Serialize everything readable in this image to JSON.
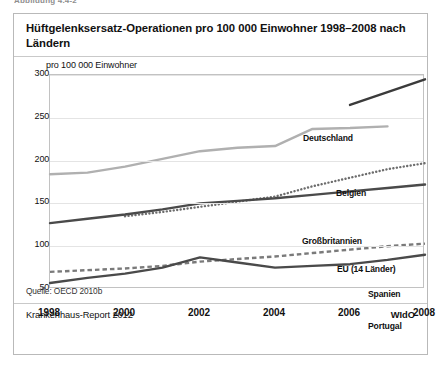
{
  "above_figure_caption": "Abbildung 4.4-2",
  "figure": {
    "title": "Hüftgelenksersatz-Operationen pro 100 000 Einwohner 1998–2008 nach Ländern",
    "source_note": "Quelle: OECD 2010b",
    "footer_left": "Krankenhaus-Report 2012",
    "footer_right": "WIdO"
  },
  "chart_data": {
    "type": "line",
    "title": "Hüftgelenksersatz-Operationen pro 100 000 Einwohner 1998–2008 nach Ländern",
    "xlabel": "",
    "ylabel": "pro 100 000 Einwohner",
    "axis_unit_label": "pro 100 000 Einwohner",
    "x": [
      1998,
      1999,
      2000,
      2001,
      2002,
      2003,
      2004,
      2005,
      2006,
      2007,
      2008
    ],
    "xlim": [
      1998,
      2008
    ],
    "ylim": [
      50,
      300
    ],
    "yticks": [
      50,
      100,
      150,
      200,
      250,
      300
    ],
    "xticks": [
      1998,
      2000,
      2002,
      2004,
      2006,
      2008
    ],
    "grid": true,
    "legend_position": "inline-right-of-line",
    "series": [
      {
        "name": "Deutschland",
        "style": "solid",
        "color": "#3b3b3b",
        "width": 2.4,
        "x": [
          2006,
          2007,
          2008
        ],
        "values": [
          265,
          280,
          295
        ]
      },
      {
        "name": "Belgien",
        "style": "solid",
        "color": "#b0b0b0",
        "width": 2.4,
        "x": [
          1998,
          1999,
          2000,
          2001,
          2002,
          2003,
          2004,
          2005,
          2006,
          2007
        ],
        "values": [
          184,
          186,
          193,
          202,
          211,
          215,
          217,
          237,
          238,
          240
        ]
      },
      {
        "name": "Großbritannien",
        "style": "dotted",
        "color": "#6d6d6d",
        "width": 2.4,
        "x": [
          2000,
          2001,
          2002,
          2003,
          2004,
          2005,
          2006,
          2007,
          2008
        ],
        "values": [
          135,
          140,
          146,
          152,
          158,
          170,
          180,
          190,
          197
        ]
      },
      {
        "name": "EU (14 Länder)",
        "style": "solid",
        "color": "#4a4a4a",
        "width": 2.4,
        "x": [
          1998,
          1999,
          2000,
          2001,
          2002,
          2003,
          2004,
          2005,
          2006,
          2007,
          2008
        ],
        "values": [
          127,
          132,
          137,
          143,
          150,
          153,
          156,
          160,
          164,
          168,
          172
        ]
      },
      {
        "name": "Spanien",
        "style": "dashed",
        "color": "#7a7a7a",
        "width": 2.4,
        "x": [
          1998,
          1999,
          2000,
          2001,
          2002,
          2003,
          2004,
          2005,
          2006,
          2007,
          2008
        ],
        "values": [
          70,
          72,
          74,
          77,
          82,
          85,
          88,
          92,
          96,
          100,
          103
        ]
      },
      {
        "name": "Portugal",
        "style": "solid",
        "color": "#4a4a4a",
        "width": 2.4,
        "x": [
          1998,
          1999,
          2000,
          2001,
          2002,
          2003,
          2004,
          2005,
          2006,
          2007,
          2008
        ],
        "values": [
          57,
          63,
          68,
          75,
          87,
          81,
          75,
          77,
          79,
          84,
          90
        ]
      }
    ],
    "series_label_positions": [
      {
        "name": "Deutschland",
        "left": 289,
        "top": 76
      },
      {
        "name": "Belgien",
        "left": 322,
        "top": 131
      },
      {
        "name": "Großbritannien",
        "left": 288,
        "top": 179
      },
      {
        "name": "EU (14 Länder)",
        "left": 323,
        "top": 207
      },
      {
        "name": "Spanien",
        "left": 354,
        "top": 232
      },
      {
        "name": "Portugal",
        "left": 354,
        "top": 264
      }
    ]
  }
}
